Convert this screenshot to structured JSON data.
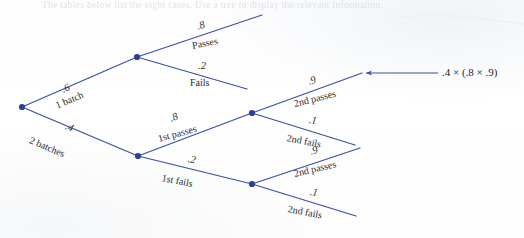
{
  "page": {
    "width": 524,
    "height": 238,
    "background_color": "#fefefe",
    "cropped_heading": "The tables below list the eight cases. Use a tree to display the relevant information."
  },
  "colors": {
    "branch_line": "#3b4fa8",
    "node_marker": "#2c3f9e",
    "label_text": "#2a2a30",
    "arrow": "#3b4fa8"
  },
  "diagram": {
    "type": "probability-tree",
    "nodes": [
      {
        "id": "root",
        "label": "root",
        "x": 22,
        "y": 107
      },
      {
        "id": "one-batch",
        "label": "1 batch",
        "x": 137,
        "y": 57
      },
      {
        "id": "two-batches",
        "label": "2 batches",
        "x": 138,
        "y": 156
      },
      {
        "id": "first-pass",
        "label": "1st passes",
        "x": 252,
        "y": 113
      },
      {
        "id": "first-fail",
        "label": "1st fails",
        "x": 252,
        "y": 184
      }
    ],
    "branches": [
      {
        "id": "b1",
        "from": "root",
        "to": "one-batch",
        "probability": ".6",
        "outcome": "1 batch",
        "x1": 22,
        "y1": 107,
        "x2": 137,
        "y2": 57
      },
      {
        "id": "b2",
        "from": "root",
        "to": "two-batches",
        "probability": ".4",
        "outcome": "2 batches",
        "x1": 22,
        "y1": 107,
        "x2": 138,
        "y2": 156
      },
      {
        "id": "b3",
        "from": "one-batch",
        "to": "passes",
        "probability": ".8",
        "outcome": "Passes",
        "x1": 137,
        "y1": 57,
        "x2": 262,
        "y2": 15
      },
      {
        "id": "b4",
        "from": "one-batch",
        "to": "fails",
        "probability": ".2",
        "outcome": "Fails",
        "x1": 137,
        "y1": 57,
        "x2": 247,
        "y2": 89
      },
      {
        "id": "b5",
        "from": "two-batches",
        "to": "first-pass",
        "probability": ".8",
        "outcome": "1st passes",
        "x1": 138,
        "y1": 156,
        "x2": 252,
        "y2": 113
      },
      {
        "id": "b6",
        "from": "two-batches",
        "to": "first-fail",
        "probability": ".2",
        "outcome": "1st fails",
        "x1": 138,
        "y1": 156,
        "x2": 252,
        "y2": 184
      },
      {
        "id": "b7",
        "from": "first-pass",
        "to": "p2-pass",
        "probability": ".9",
        "outcome": "2nd passes",
        "x1": 252,
        "y1": 113,
        "x2": 362,
        "y2": 73
      },
      {
        "id": "b8",
        "from": "first-pass",
        "to": "p2-fail",
        "probability": ".1",
        "outcome": "2nd fails",
        "x1": 252,
        "y1": 113,
        "x2": 355,
        "y2": 145
      },
      {
        "id": "b9",
        "from": "first-fail",
        "to": "f2-pass",
        "probability": ".9",
        "outcome": "2nd passes",
        "x1": 252,
        "y1": 184,
        "x2": 360,
        "y2": 148
      },
      {
        "id": "b10",
        "from": "first-fail",
        "to": "f2-fail",
        "probability": ".1",
        "outcome": "2nd fails",
        "x1": 252,
        "y1": 184,
        "x2": 356,
        "y2": 216
      }
    ],
    "annotation": {
      "text": ".4 × (.8 × .9)",
      "arrow_from_x": 438,
      "arrow_to_x": 364,
      "arrow_y": 73
    }
  },
  "labels": {
    "p_6": ".6",
    "t_one_batch": "1 batch",
    "p_4": ".4",
    "t_two_batches": "2 batches",
    "p_8_top": ".8",
    "t_passes": "Passes",
    "p_2_top": ".2",
    "t_fails": "Fails",
    "p_8_bottom": ".8",
    "t_first_passes": "1st passes",
    "p_2_bottom": ".2",
    "t_first_fails": "1st fails",
    "p_9_upper": ".9",
    "t_2nd_passes_upper": "2nd passes",
    "p_1_upper": ".1",
    "t_2nd_fails_upper": "2nd fails",
    "p_9_lower": ".9",
    "t_2nd_passes_lower": "2nd passes",
    "p_1_lower": ".1",
    "t_2nd_fails_lower": "2nd fails"
  }
}
